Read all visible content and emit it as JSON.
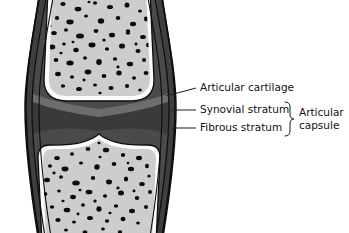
{
  "figure": {
    "background_color": "#ffffff"
  },
  "labels": {
    "articular_cartilage": "Articular cartilage",
    "synovial_stratum": "Synovial stratum",
    "fibrous_stratum": "Fibrous stratum",
    "articular_capsule_line1": "Articular",
    "articular_capsule_line2": "capsule"
  },
  "colors": {
    "bone_marrow": "#cdcdcd",
    "trabecula": "#0a0a0a",
    "cartilage": "#fbfbfb",
    "capsule_dark": "#3f3f3f",
    "capsule_mid": "#6d6d6d",
    "outline": "#0d0d0d",
    "text": "#121212",
    "background": "#ffffff"
  },
  "structures": {
    "upper_bone": "upper epiphysis with trabecular bone",
    "lower_bone": "lower epiphysis with trabecular bone",
    "joint_cavity": "joint cavity between articular surfaces",
    "capsule_layers": "fibrous and synovial strata of articular capsule"
  }
}
